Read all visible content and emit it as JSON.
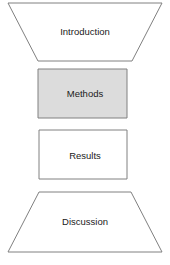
{
  "diagram": {
    "type": "flow-stages",
    "canvas": {
      "width": 170,
      "height": 265,
      "background": "#ffffff"
    },
    "style": {
      "stroke_color": "#808080",
      "stroke_width": 1,
      "text_color": "#1a1a1a",
      "highlight_fill": "#dcdcdc",
      "plain_fill": "#ffffff"
    },
    "stages": [
      {
        "id": "introduction",
        "label": "Introduction",
        "shape": "inverted-trapezoid",
        "fill": "#ffffff",
        "points": "8,3 162,3 132,61 38,61",
        "label_x": 85,
        "label_y": 32,
        "highlighted": false
      },
      {
        "id": "methods",
        "label": "Methods",
        "shape": "rectangle",
        "fill": "#dcdcdc",
        "points": "38,69 127,69 127,118 38,118",
        "label_x": 85,
        "label_y": 94,
        "highlighted": true
      },
      {
        "id": "results",
        "label": "Results",
        "shape": "rectangle",
        "fill": "#ffffff",
        "points": "39,130 127,130 127,179 39,179",
        "label_x": 85,
        "label_y": 156,
        "highlighted": false
      },
      {
        "id": "discussion",
        "label": "Discussion",
        "shape": "trapezoid",
        "fill": "#ffffff",
        "points": "39,192 131,192 162,252 8,252",
        "label_x": 85,
        "label_y": 222,
        "highlighted": false
      }
    ]
  }
}
